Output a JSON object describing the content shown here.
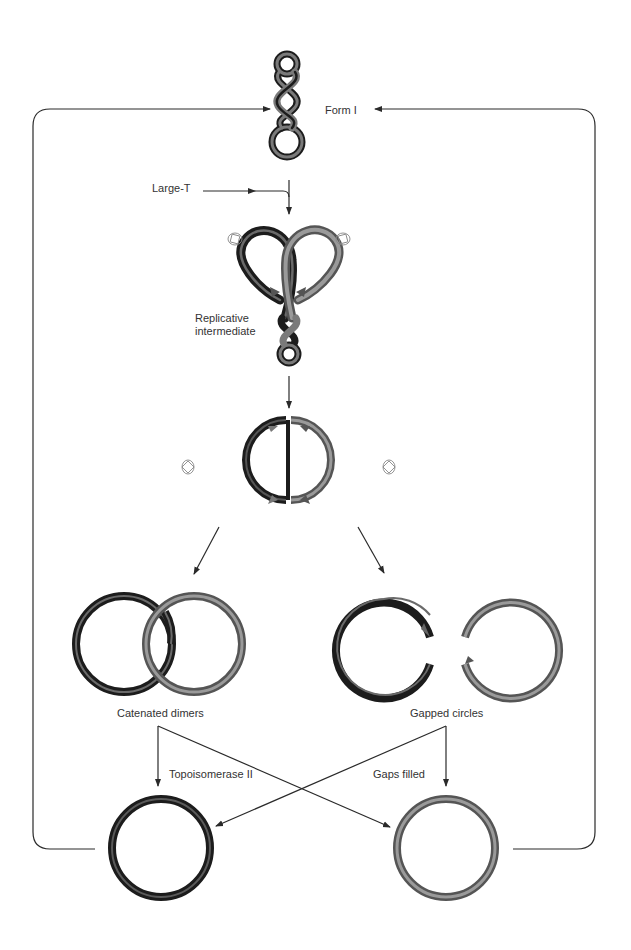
{
  "diagram": {
    "colors": {
      "dark_strand": "#1c1c1c",
      "light_strand": "#7a7a7a",
      "light_strand_edge": "#555555",
      "line": "#2a2a2a",
      "enzyme_icon": "#888888",
      "background": "#ffffff"
    },
    "nodes": [
      {
        "id": "form-i",
        "label": "Form I"
      },
      {
        "id": "large-t",
        "label": "Large-T"
      },
      {
        "id": "replicative-intermediate",
        "label": "Replicative\nintermediate"
      },
      {
        "id": "late-replicative-intermediate",
        "label": ""
      },
      {
        "id": "catenated-dimers",
        "label": "Catenated dimers"
      },
      {
        "id": "gapped-circles",
        "label": "Gapped circles"
      },
      {
        "id": "closed-dark-circle",
        "label": ""
      },
      {
        "id": "closed-light-circle",
        "label": ""
      }
    ],
    "edge_labels": {
      "topoisomerase": "Topoisomerase II",
      "gaps_filled": "Gaps filled"
    },
    "edges": [
      {
        "from": "large-t",
        "to": "form-i-pathway",
        "label": ""
      },
      {
        "from": "form-i",
        "to": "replicative-intermediate",
        "label": ""
      },
      {
        "from": "replicative-intermediate",
        "to": "late-replicative-intermediate",
        "label": ""
      },
      {
        "from": "late-replicative-intermediate",
        "to": "catenated-dimers",
        "label": ""
      },
      {
        "from": "late-replicative-intermediate",
        "to": "gapped-circles",
        "label": ""
      },
      {
        "from": "catenated-dimers",
        "to": "closed-dark-circle",
        "label": "Topoisomerase II"
      },
      {
        "from": "catenated-dimers",
        "to": "closed-light-circle",
        "label": "Topoisomerase II"
      },
      {
        "from": "gapped-circles",
        "to": "closed-light-circle",
        "label": "Gaps filled"
      },
      {
        "from": "gapped-circles",
        "to": "closed-dark-circle",
        "label": "Gaps filled"
      },
      {
        "from": "closed-dark-circle",
        "to": "form-i",
        "label": ""
      },
      {
        "from": "closed-light-circle",
        "to": "form-i",
        "label": ""
      }
    ],
    "labels": {
      "form_i": "Form I",
      "large_t": "Large-T",
      "replicative": "Replicative",
      "intermediate": "intermediate",
      "catenated": "Catenated dimers",
      "gapped": "Gapped circles",
      "topo": "Topoisomerase II",
      "filled": "Gaps filled"
    }
  }
}
